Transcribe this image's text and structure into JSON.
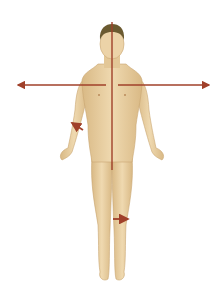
{
  "figure": {
    "colors": {
      "background": "#ffffff",
      "skin": "#e8cda0",
      "skin_shadow": "#d2b07c",
      "hair": "#6b5a30",
      "arrow": "#a0402a"
    },
    "arrows": [
      {
        "name": "midline-vertical",
        "direction": "vertical"
      },
      {
        "name": "lateral-left",
        "direction": "left"
      },
      {
        "name": "lateral-right",
        "direction": "right"
      },
      {
        "name": "forearm-arrow",
        "direction": "up-left"
      },
      {
        "name": "leg-arrow",
        "direction": "right"
      }
    ]
  }
}
